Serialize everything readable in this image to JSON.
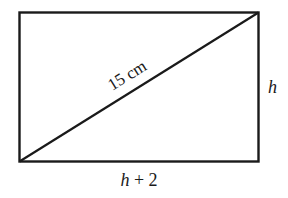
{
  "diagram": {
    "shape": "rectangle",
    "diagonal_label": "15 cm",
    "right_side_label": "h",
    "bottom_side_label": "h + 2",
    "stroke_color": "#1a1a1a"
  }
}
